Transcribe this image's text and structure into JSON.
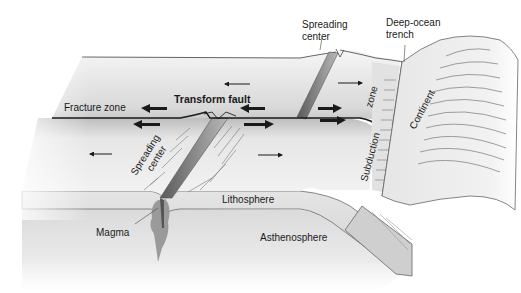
{
  "labels": {
    "spreading_center_top_line1": "Spreading",
    "spreading_center_top_line2": "center",
    "deep_ocean_trench_line1": "Deep-ocean",
    "deep_ocean_trench_line2": "trench",
    "fracture_zone": "Fracture zone",
    "transform_fault": "Transform fault",
    "spreading_center_lower_line1": "Spreading",
    "spreading_center_lower_line2": "center",
    "subduction_zone_part1": "Subduction",
    "subduction_zone_part2": "zone",
    "continent": "Continent",
    "lithosphere": "Lithosphere",
    "magma": "Magma",
    "asthenosphere": "Asthenosphere"
  },
  "colors": {
    "plate_surface_light": "#f4f4f4",
    "plate_surface_mid": "#d9d9d9",
    "lithosphere": "#d6d6d6",
    "asthenosphere": "#e3e3e3",
    "magma": "#8e8e8e",
    "ridge_band": "#8a8a8a",
    "outline": "#555555",
    "fault_line": "#1a1a1a",
    "arrow": "#1a1a1a"
  }
}
